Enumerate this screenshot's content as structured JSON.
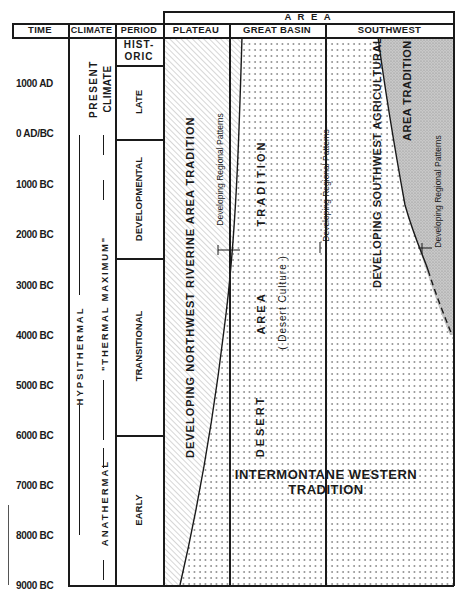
{
  "header": {
    "area_title": "A R E A",
    "columns": {
      "time": "TIME",
      "climate": "CLIMATE",
      "period": "PERIOD",
      "plateau": "PLATEAU",
      "great_basin": "GREAT BASIN",
      "southwest": "SOUTHWEST"
    }
  },
  "time_scale": [
    {
      "label": "1000 AD",
      "y": 83
    },
    {
      "label": "0 AD/BC",
      "y": 133
    },
    {
      "label": "1000 BC",
      "y": 184
    },
    {
      "label": "2000 BC",
      "y": 234
    },
    {
      "label": "3000 BC",
      "y": 285
    },
    {
      "label": "4000 BC",
      "y": 335
    },
    {
      "label": "5000 BC",
      "y": 385
    },
    {
      "label": "6000 BC",
      "y": 435
    },
    {
      "label": "7000 BC",
      "y": 485
    },
    {
      "label": "8000 BC",
      "y": 535
    },
    {
      "label": "9000 BC",
      "y": 585
    }
  ],
  "climate": {
    "present_line1": "PRESENT",
    "present_line2": "CLIMATE",
    "hypsithermal": "HYPSITHERMAL",
    "thermal_maximum": "\"THERMAL MAXIMUM\"",
    "anathermal": "ANATHERMAL"
  },
  "periods": [
    {
      "label_line1": "HIST-",
      "label_line2": "ORIC",
      "top": 37,
      "bottom": 65
    },
    {
      "label": "LATE",
      "top": 65,
      "bottom": 139
    },
    {
      "label": "DEVELOPMENTAL",
      "top": 139,
      "bottom": 258
    },
    {
      "label": "TRANSITIONAL",
      "top": 258,
      "bottom": 435
    },
    {
      "label": "EARLY",
      "top": 435,
      "bottom": 585
    }
  ],
  "areas": {
    "plateau": {
      "tradition": "DEVELOPING NORTHWEST RIVERINE AREA TRADITION",
      "regional": "Developing Regional Patterns"
    },
    "great_basin": {
      "tradition_line1": "DESERT",
      "tradition_line2": "AREA",
      "tradition_line3": "TRADITION",
      "subtitle": "( Desert Culture )",
      "regional": "Developing Regional Patterns"
    },
    "southwest": {
      "tradition_line1": "DEVELOPING SOUTHWEST AGRICULTURAL",
      "tradition_line2": "AREA TRADITION",
      "regional": "Developing Regional Patterns"
    },
    "intermontane_line1": "INTERMONTANE  WESTERN",
    "intermontane_line2": "TRADITION"
  },
  "colors": {
    "ink": "#1a1a1a",
    "paper": "#ffffff",
    "stipple": "#bdbdbd"
  }
}
